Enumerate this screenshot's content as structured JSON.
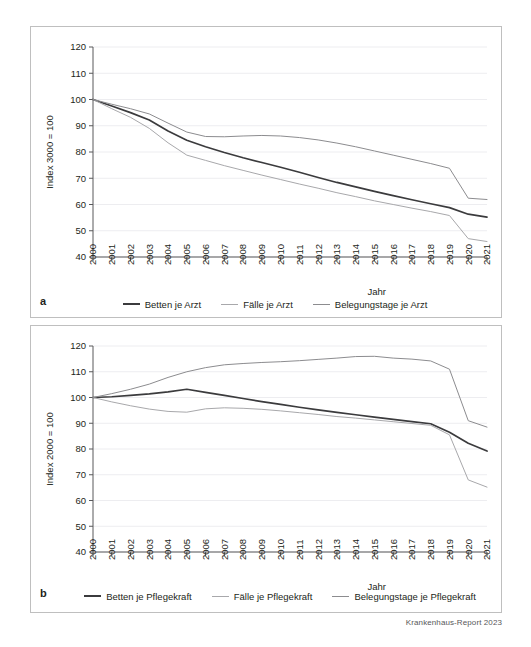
{
  "figure": {
    "footer_credit": "Krankenhaus-Report 2023",
    "panel_a_label": "a",
    "panel_b_label": "b"
  },
  "colors": {
    "series_dark": "#3b3b3d",
    "series_light": "#a8a8ab",
    "series_mid": "#8c8c8f",
    "axis": "#58585a",
    "grid": "#ededf0",
    "panel_border": "#bfbfbf",
    "text": "#231f20"
  },
  "chart_data": [
    {
      "id": "chart-a",
      "type": "line",
      "title": "",
      "xlabel": "Jahr",
      "ylabel": "Index 3000 = 100",
      "ylim": [
        40,
        120
      ],
      "yticks": [
        40,
        50,
        60,
        70,
        80,
        90,
        100,
        110,
        120
      ],
      "grid": true,
      "legend_position": "bottom",
      "x": [
        2000,
        2001,
        2002,
        2003,
        2004,
        2005,
        2006,
        2007,
        2008,
        2009,
        2010,
        2011,
        2012,
        2013,
        2014,
        2015,
        2016,
        2017,
        2018,
        2019,
        2020,
        2021
      ],
      "categories": [
        "2000",
        "2001",
        "2002",
        "2003",
        "2004",
        "2005",
        "2006",
        "2007",
        "2008",
        "2009",
        "2010",
        "2011",
        "2012",
        "2013",
        "2014",
        "2015",
        "2016",
        "2017",
        "2018",
        "2019",
        "2020",
        "2021"
      ],
      "series": [
        {
          "name": "Betten je Arzt",
          "color": "#3b3b3d",
          "values": [
            100.0,
            97.5,
            95.0,
            92.2,
            88.0,
            84.5,
            82.0,
            79.8,
            77.8,
            76.0,
            74.2,
            72.3,
            70.3,
            68.4,
            66.7,
            65.0,
            63.4,
            61.8,
            60.3,
            58.8,
            56.3,
            55.2
          ]
        },
        {
          "name": "Fälle je Arzt",
          "color": "#a8a8ab",
          "values": [
            100.0,
            96.5,
            93.2,
            89.0,
            83.5,
            78.8,
            76.8,
            74.8,
            73.0,
            71.2,
            69.5,
            67.8,
            66.2,
            64.5,
            63.0,
            61.4,
            60.0,
            58.6,
            57.3,
            55.8,
            47.0,
            45.9
          ]
        },
        {
          "name": "Belegungstage je Arzt",
          "color": "#8c8c8f",
          "values": [
            100.0,
            98.2,
            96.5,
            94.5,
            91.0,
            87.6,
            85.9,
            85.8,
            86.1,
            86.3,
            86.1,
            85.5,
            84.6,
            83.4,
            82.0,
            80.4,
            78.8,
            77.2,
            75.6,
            73.8,
            62.4,
            61.9
          ]
        }
      ]
    },
    {
      "id": "chart-b",
      "type": "line",
      "title": "",
      "xlabel": "Jahr",
      "ylabel": "Index 2000 = 100",
      "ylim": [
        40,
        120
      ],
      "yticks": [
        40,
        50,
        60,
        70,
        80,
        90,
        100,
        110,
        120
      ],
      "grid": true,
      "legend_position": "bottom",
      "x": [
        2000,
        2001,
        2002,
        2003,
        2004,
        2005,
        2006,
        2007,
        2008,
        2009,
        2010,
        2011,
        2012,
        2013,
        2014,
        2015,
        2016,
        2017,
        2018,
        2019,
        2020,
        2021
      ],
      "categories": [
        "2000",
        "2001",
        "2002",
        "2003",
        "2004",
        "2005",
        "2006",
        "2007",
        "2008",
        "2009",
        "2010",
        "2011",
        "2012",
        "2013",
        "2014",
        "2015",
        "2016",
        "2017",
        "2018",
        "2019",
        "2020",
        "2021"
      ],
      "series": [
        {
          "name": "Betten je Pflegekraft",
          "color": "#3b3b3d",
          "values": [
            100.0,
            100.3,
            100.8,
            101.4,
            102.2,
            103.2,
            102.0,
            100.8,
            99.6,
            98.4,
            97.3,
            96.2,
            95.2,
            94.2,
            93.3,
            92.4,
            91.5,
            90.6,
            89.8,
            86.5,
            82.2,
            79.2
          ]
        },
        {
          "name": "Fälle je Pflegekraft",
          "color": "#a8a8ab",
          "values": [
            100.0,
            98.3,
            96.8,
            95.5,
            94.6,
            94.3,
            95.6,
            96.0,
            95.8,
            95.4,
            94.8,
            94.1,
            93.4,
            92.6,
            92.0,
            91.3,
            90.6,
            89.9,
            89.2,
            85.5,
            68.0,
            65.2
          ]
        },
        {
          "name": "Belegungstage je Pflegekraft",
          "color": "#8c8c8f",
          "values": [
            100.0,
            101.5,
            103.2,
            105.2,
            107.8,
            110.0,
            111.6,
            112.7,
            113.2,
            113.6,
            113.9,
            114.3,
            114.8,
            115.3,
            115.9,
            116.0,
            115.3,
            114.9,
            114.2,
            111.0,
            91.0,
            88.5
          ]
        }
      ]
    }
  ]
}
